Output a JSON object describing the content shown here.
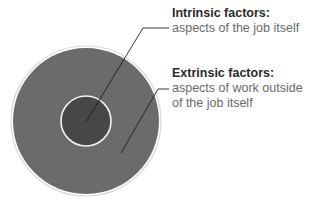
{
  "diagram": {
    "type": "concentric-circles",
    "colors": {
      "outer_circle": "#6b6b6b",
      "inner_circle": "#474747",
      "ring_stroke": "#f2f2f2",
      "outer_border": "#d9d9d9",
      "leader_line": "#1e1e1e",
      "title_text": "#2a2a2a",
      "body_text": "#6a6a6a"
    },
    "intrinsic": {
      "title": "Intrinsic factors:",
      "description": "aspects of the job itself"
    },
    "extrinsic": {
      "title": "Extrinsic factors:",
      "description": "aspects of work outside of the job itself"
    }
  }
}
